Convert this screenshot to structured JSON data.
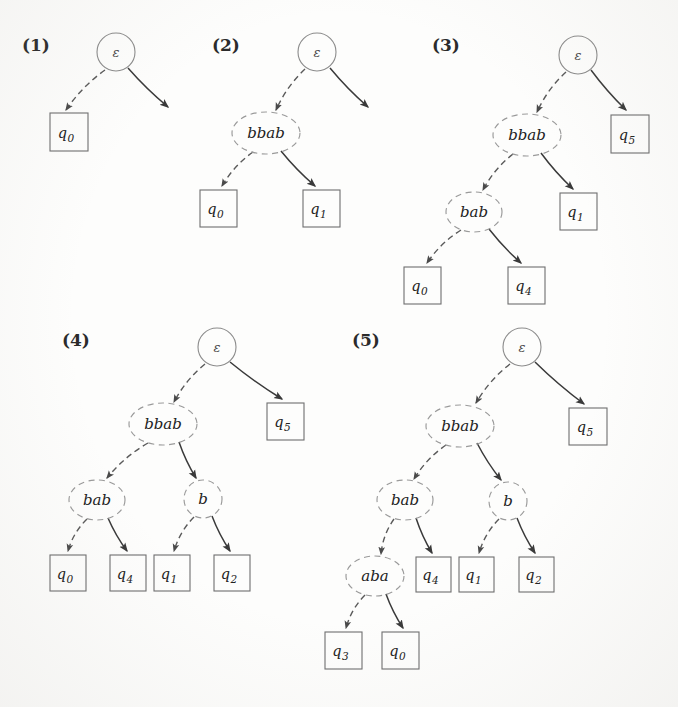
{
  "figure": {
    "type": "tree-diagram-sequence",
    "ink_color": "#3a3a3a",
    "dashed_node_color": "#9a9a9a",
    "solid_node_color": "#6e6e6e"
  },
  "trees": [
    {
      "label": "(1)",
      "label_x": 22,
      "label_y": 51,
      "root": {
        "name": "root-1",
        "text": "ε",
        "shape": "circle",
        "cx": 116,
        "cy": 52,
        "r": 19
      },
      "inner": [],
      "leaves": [
        {
          "name": "leaf-q0",
          "text": "q",
          "sub": "0",
          "x": 50,
          "y": 113,
          "w": 38,
          "h": 38
        }
      ],
      "edges": [
        {
          "from": "root-1",
          "to": "leaf-q0",
          "style": "dashed",
          "x1": 105,
          "y1": 70,
          "x2": 66,
          "y2": 110
        },
        {
          "from": "root-1",
          "to": "dangling",
          "style": "solid",
          "x1": 128,
          "y1": 68,
          "x2": 168,
          "y2": 107
        }
      ]
    },
    {
      "label": "(2)",
      "label_x": 212,
      "label_y": 51,
      "root": {
        "name": "root-2",
        "text": "ε",
        "shape": "circle",
        "cx": 317,
        "cy": 52,
        "r": 19
      },
      "inner": [
        {
          "name": "node-bbab",
          "text": "bbab",
          "shape": "ellipse",
          "cx": 266,
          "cy": 133,
          "rx": 34,
          "ry": 21
        }
      ],
      "leaves": [
        {
          "name": "leaf-q0",
          "text": "q",
          "sub": "0",
          "x": 200,
          "y": 190,
          "w": 37,
          "h": 37
        },
        {
          "name": "leaf-q1",
          "text": "q",
          "sub": "1",
          "x": 303,
          "y": 190,
          "w": 37,
          "h": 37
        }
      ],
      "edges": [
        {
          "from": "root-2",
          "to": "node-bbab",
          "style": "dashed",
          "x1": 305,
          "y1": 69,
          "x2": 276,
          "y2": 110
        },
        {
          "from": "root-2",
          "to": "dangling",
          "style": "solid",
          "x1": 330,
          "y1": 68,
          "x2": 368,
          "y2": 107
        },
        {
          "from": "node-bbab",
          "to": "leaf-q0",
          "style": "dashed",
          "x1": 253,
          "y1": 152,
          "x2": 222,
          "y2": 186
        },
        {
          "from": "node-bbab",
          "to": "leaf-q1",
          "style": "solid",
          "x1": 281,
          "y1": 151,
          "x2": 315,
          "y2": 186
        }
      ]
    },
    {
      "label": "(3)",
      "label_x": 432,
      "label_y": 51,
      "root": {
        "name": "root-3",
        "text": "ε",
        "shape": "circle",
        "cx": 578,
        "cy": 55,
        "r": 19
      },
      "inner": [
        {
          "name": "node-bbab",
          "text": "bbab",
          "shape": "ellipse",
          "cx": 527,
          "cy": 135,
          "rx": 34,
          "ry": 21
        },
        {
          "name": "node-bab",
          "text": "bab",
          "shape": "ellipse",
          "cx": 474,
          "cy": 212,
          "rx": 28,
          "ry": 20
        }
      ],
      "leaves": [
        {
          "name": "leaf-q5",
          "text": "q",
          "sub": "5",
          "x": 611,
          "y": 115,
          "w": 38,
          "h": 38
        },
        {
          "name": "leaf-q1",
          "text": "q",
          "sub": "1",
          "x": 560,
          "y": 193,
          "w": 37,
          "h": 37
        },
        {
          "name": "leaf-q0",
          "text": "q",
          "sub": "0",
          "x": 404,
          "y": 267,
          "w": 37,
          "h": 37
        },
        {
          "name": "leaf-q4",
          "text": "q",
          "sub": "4",
          "x": 508,
          "y": 267,
          "w": 37,
          "h": 37
        }
      ],
      "edges": [
        {
          "from": "root-3",
          "to": "node-bbab",
          "style": "dashed",
          "x1": 566,
          "y1": 72,
          "x2": 537,
          "y2": 112
        },
        {
          "from": "root-3",
          "to": "leaf-q5",
          "style": "solid",
          "x1": 591,
          "y1": 70,
          "x2": 626,
          "y2": 110
        },
        {
          "from": "node-bbab",
          "to": "node-bab",
          "style": "dashed",
          "x1": 513,
          "y1": 154,
          "x2": 483,
          "y2": 190
        },
        {
          "from": "node-bbab",
          "to": "leaf-q1",
          "style": "solid",
          "x1": 541,
          "y1": 153,
          "x2": 573,
          "y2": 189
        },
        {
          "from": "node-bab",
          "to": "leaf-q0",
          "style": "dashed",
          "x1": 461,
          "y1": 230,
          "x2": 427,
          "y2": 263
        },
        {
          "from": "node-bab",
          "to": "leaf-q4",
          "style": "solid",
          "x1": 489,
          "y1": 229,
          "x2": 521,
          "y2": 263
        }
      ]
    },
    {
      "label": "(4)",
      "label_x": 62,
      "label_y": 346,
      "root": {
        "name": "root-4",
        "text": "ε",
        "shape": "circle",
        "cx": 217,
        "cy": 347,
        "r": 19
      },
      "inner": [
        {
          "name": "node-bbab",
          "text": "bbab",
          "shape": "ellipse",
          "cx": 163,
          "cy": 424,
          "rx": 34,
          "ry": 21
        },
        {
          "name": "node-bab",
          "text": "bab",
          "shape": "ellipse",
          "cx": 97,
          "cy": 500,
          "rx": 28,
          "ry": 20
        },
        {
          "name": "node-b",
          "text": "b",
          "shape": "ellipse",
          "cx": 203,
          "cy": 499,
          "rx": 19,
          "ry": 19
        }
      ],
      "leaves": [
        {
          "name": "leaf-q5",
          "text": "q",
          "sub": "5",
          "x": 267,
          "y": 403,
          "w": 37,
          "h": 37
        },
        {
          "name": "leaf-q0",
          "text": "q",
          "sub": "0",
          "x": 50,
          "y": 555,
          "w": 36,
          "h": 36
        },
        {
          "name": "leaf-q4",
          "text": "q",
          "sub": "4",
          "x": 110,
          "y": 555,
          "w": 36,
          "h": 36
        },
        {
          "name": "leaf-q1",
          "text": "q",
          "sub": "1",
          "x": 154,
          "y": 555,
          "w": 36,
          "h": 36
        },
        {
          "name": "leaf-q2",
          "text": "q",
          "sub": "2",
          "x": 214,
          "y": 555,
          "w": 36,
          "h": 36
        }
      ],
      "edges": [
        {
          "from": "root-4",
          "to": "node-bbab",
          "style": "dashed",
          "x1": 205,
          "y1": 364,
          "x2": 174,
          "y2": 402
        },
        {
          "from": "root-4",
          "to": "leaf-q5",
          "style": "solid",
          "x1": 230,
          "y1": 362,
          "x2": 282,
          "y2": 399
        },
        {
          "from": "node-bbab",
          "to": "node-bab",
          "style": "dashed",
          "x1": 148,
          "y1": 443,
          "x2": 107,
          "y2": 478
        },
        {
          "from": "node-bbab",
          "to": "node-b",
          "style": "solid",
          "x1": 179,
          "y1": 442,
          "x2": 196,
          "y2": 478
        },
        {
          "from": "node-bab",
          "to": "leaf-q0",
          "style": "dashed",
          "x1": 87,
          "y1": 519,
          "x2": 68,
          "y2": 551
        },
        {
          "from": "node-bab",
          "to": "leaf-q4",
          "style": "solid",
          "x1": 108,
          "y1": 518,
          "x2": 127,
          "y2": 551
        },
        {
          "from": "node-b",
          "to": "leaf-q1",
          "style": "dashed",
          "x1": 194,
          "y1": 517,
          "x2": 174,
          "y2": 551
        },
        {
          "from": "node-b",
          "to": "leaf-q2",
          "style": "solid",
          "x1": 212,
          "y1": 516,
          "x2": 230,
          "y2": 551
        }
      ]
    },
    {
      "label": "(5)",
      "label_x": 352,
      "label_y": 346,
      "root": {
        "name": "root-5",
        "text": "ε",
        "shape": "circle",
        "cx": 522,
        "cy": 347,
        "r": 19
      },
      "inner": [
        {
          "name": "node-bbab",
          "text": "bbab",
          "shape": "ellipse",
          "cx": 460,
          "cy": 426,
          "rx": 34,
          "ry": 21
        },
        {
          "name": "node-bab",
          "text": "bab",
          "shape": "ellipse",
          "cx": 405,
          "cy": 500,
          "rx": 28,
          "ry": 20
        },
        {
          "name": "node-b",
          "text": "b",
          "shape": "ellipse",
          "cx": 508,
          "cy": 501,
          "rx": 19,
          "ry": 19
        },
        {
          "name": "node-aba",
          "text": "aba",
          "shape": "ellipse",
          "cx": 375,
          "cy": 576,
          "rx": 29,
          "ry": 20
        }
      ],
      "leaves": [
        {
          "name": "leaf-q5",
          "text": "q",
          "sub": "5",
          "x": 569,
          "y": 408,
          "w": 38,
          "h": 37
        },
        {
          "name": "leaf-q4",
          "text": "q",
          "sub": "4",
          "x": 416,
          "y": 557,
          "w": 35,
          "h": 35
        },
        {
          "name": "leaf-q1",
          "text": "q",
          "sub": "1",
          "x": 459,
          "y": 557,
          "w": 35,
          "h": 35
        },
        {
          "name": "leaf-q2",
          "text": "q",
          "sub": "2",
          "x": 519,
          "y": 557,
          "w": 35,
          "h": 35
        },
        {
          "name": "leaf-q3",
          "text": "q",
          "sub": "3",
          "x": 325,
          "y": 632,
          "w": 37,
          "h": 37
        },
        {
          "name": "leaf-q0",
          "text": "q",
          "sub": "0",
          "x": 382,
          "y": 632,
          "w": 37,
          "h": 37
        }
      ],
      "edges": [
        {
          "from": "root-5",
          "to": "node-bbab",
          "style": "dashed",
          "x1": 510,
          "y1": 364,
          "x2": 476,
          "y2": 403
        },
        {
          "from": "root-5",
          "to": "leaf-q5",
          "style": "solid",
          "x1": 535,
          "y1": 362,
          "x2": 584,
          "y2": 404
        },
        {
          "from": "node-bbab",
          "to": "node-bab",
          "style": "dashed",
          "x1": 446,
          "y1": 445,
          "x2": 414,
          "y2": 479
        },
        {
          "from": "node-bbab",
          "to": "node-b",
          "style": "solid",
          "x1": 477,
          "y1": 443,
          "x2": 501,
          "y2": 480
        },
        {
          "from": "node-bab",
          "to": "node-aba",
          "style": "dashed",
          "x1": 394,
          "y1": 519,
          "x2": 381,
          "y2": 554
        },
        {
          "from": "node-bab",
          "to": "leaf-q4",
          "style": "solid",
          "x1": 416,
          "y1": 518,
          "x2": 432,
          "y2": 553
        },
        {
          "from": "node-b",
          "to": "leaf-q1",
          "style": "dashed",
          "x1": 499,
          "y1": 519,
          "x2": 479,
          "y2": 553
        },
        {
          "from": "node-b",
          "to": "leaf-q2",
          "style": "solid",
          "x1": 517,
          "y1": 518,
          "x2": 535,
          "y2": 553
        },
        {
          "from": "node-aba",
          "to": "leaf-q3",
          "style": "dashed",
          "x1": 365,
          "y1": 595,
          "x2": 346,
          "y2": 628
        },
        {
          "from": "node-aba",
          "to": "leaf-q0",
          "style": "solid",
          "x1": 386,
          "y1": 594,
          "x2": 403,
          "y2": 628
        }
      ]
    }
  ]
}
